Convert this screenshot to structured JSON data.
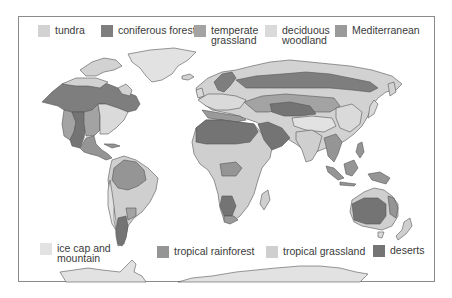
{
  "map": {
    "title": "World biomes map",
    "colors": {
      "tundra": "#d2d2d2",
      "coniferous_forest": "#7e7e7e",
      "temperate_grassland": "#a3a3a3",
      "deciduous_woodland": "#dadada",
      "mediterranean": "#9a9a9a",
      "ice_cap_and_mountain": "#e2e2e2",
      "tropical_rainforest": "#959595",
      "tropical_grassland": "#cfcfcf",
      "deserts": "#747474",
      "outline": "#555555"
    }
  },
  "legend": {
    "top": [
      {
        "key": "tundra",
        "label": "tundra",
        "color": "#d2d2d2"
      },
      {
        "key": "coniferous_forest",
        "label": "coniferous forest",
        "color": "#7e7e7e"
      },
      {
        "key": "temperate_grassland",
        "label": "temperate\ngrassland",
        "color": "#a3a3a3"
      },
      {
        "key": "deciduous_woodland",
        "label": "deciduous\nwoodland",
        "color": "#dadada"
      },
      {
        "key": "mediterranean",
        "label": "Mediterranean",
        "color": "#9a9a9a"
      }
    ],
    "bottom": [
      {
        "key": "ice_cap_and_mountain",
        "label": "ice cap and\nmountain",
        "color": "#e2e2e2"
      },
      {
        "key": "tropical_rainforest",
        "label": "tropical rainforest",
        "color": "#959595"
      },
      {
        "key": "tropical_grassland",
        "label": "tropical grassland",
        "color": "#cfcfcf"
      },
      {
        "key": "deserts",
        "label": "deserts",
        "color": "#747474"
      }
    ]
  }
}
